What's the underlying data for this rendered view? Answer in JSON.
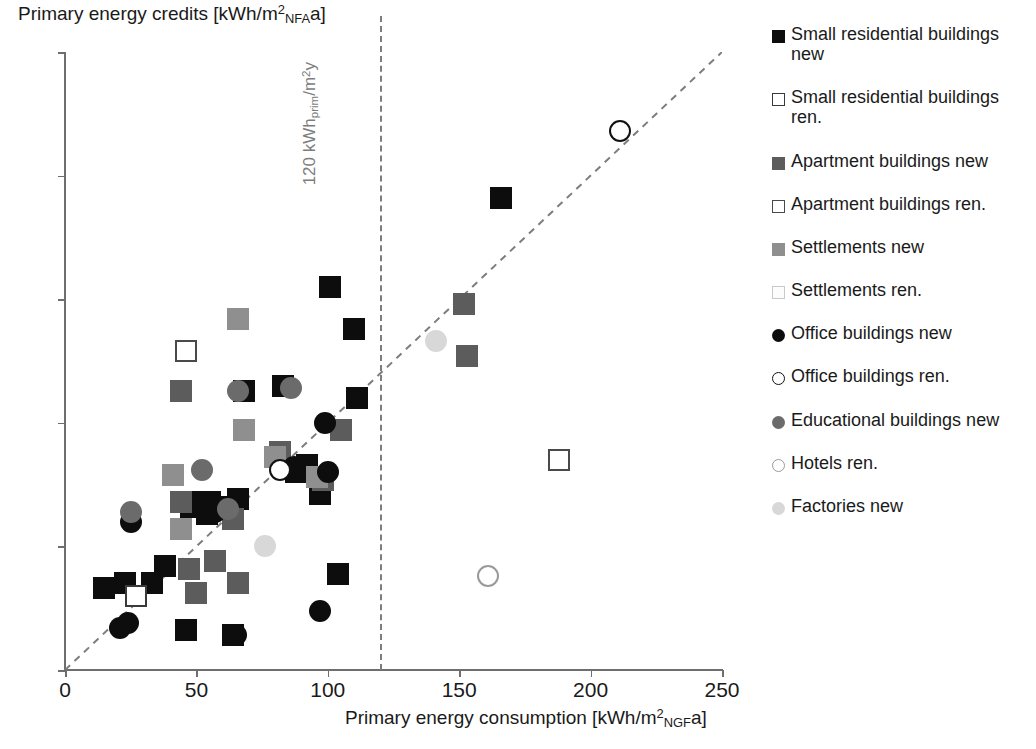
{
  "chart_data": {
    "type": "scatter",
    "title": "",
    "xlabel": "Primary energy consumption [kWh/m²NGFa]",
    "ylabel": "Primary energy credits [kWh/m²NFAa]",
    "xlabel_parts": {
      "pre": "Primary energy consumption [kWh/m",
      "sup": "2",
      "sub": "NGF",
      "post": "a]"
    },
    "ylabel_parts": {
      "pre": "Primary energy credits [kWh/m",
      "sup": "2",
      "sub": "NFA",
      "post": "a]"
    },
    "xlim": [
      0,
      250
    ],
    "ylim": [
      0,
      250
    ],
    "xticks": [
      0,
      50,
      100,
      150,
      200,
      250
    ],
    "yticks": [
      0,
      50,
      100,
      150,
      200,
      250
    ],
    "grid": false,
    "legend_position": "right",
    "annotations": [
      {
        "name": "zero-energy-line",
        "text": "zero energy",
        "type": "diagonal-dashed",
        "slope": 1,
        "intercept": 0,
        "color": "#7d7d7d"
      },
      {
        "name": "threshold-line",
        "text": "120 kWhprim/m²y",
        "text_parts": {
          "pre": "120 kWh",
          "sub": "prim",
          "post": "/m",
          "sup": "2",
          "tail": "y"
        },
        "type": "vertical-dashed",
        "x": 120,
        "color": "#7d7d7d"
      }
    ],
    "series": [
      {
        "name": "Small residential buildings new",
        "marker": "square",
        "fill": "#0d0d0d",
        "stroke": "#0d0d0d",
        "open": false,
        "points": [
          [
            15,
            33
          ],
          [
            23,
            35
          ],
          [
            33,
            35
          ],
          [
            38,
            42
          ],
          [
            46,
            16
          ],
          [
            47,
            68
          ],
          [
            48,
            66
          ],
          [
            54,
            63
          ],
          [
            55,
            68
          ],
          [
            60,
            66
          ],
          [
            64,
            14
          ],
          [
            66,
            69
          ],
          [
            68,
            113
          ],
          [
            83,
            115
          ],
          [
            88,
            80
          ],
          [
            92,
            83
          ],
          [
            97,
            71
          ],
          [
            101,
            155
          ],
          [
            104,
            39
          ],
          [
            110,
            138
          ],
          [
            111,
            110
          ],
          [
            166,
            191
          ]
        ]
      },
      {
        "name": "Small residential buildings ren.",
        "marker": "square",
        "fill": "#ffffff",
        "stroke": "#3a3a3a",
        "open": true,
        "points": [
          [
            27,
            30
          ]
        ]
      },
      {
        "name": "Apartment buildings new",
        "marker": "square",
        "fill": "#5c5c5c",
        "stroke": "#5c5c5c",
        "open": false,
        "points": [
          [
            44,
            113
          ],
          [
            44,
            68
          ],
          [
            47,
            41
          ],
          [
            50,
            31
          ],
          [
            57,
            44
          ],
          [
            64,
            61
          ],
          [
            66,
            35
          ],
          [
            82,
            88
          ],
          [
            98,
            77
          ],
          [
            105,
            97
          ],
          [
            152,
            148
          ],
          [
            153,
            127
          ]
        ]
      },
      {
        "name": "Apartment buildings ren.",
        "marker": "square",
        "fill": "#ffffff",
        "stroke": "#4a4a4a",
        "open": true,
        "points": [
          [
            46,
            129
          ],
          [
            188,
            85
          ]
        ]
      },
      {
        "name": "Settlements new",
        "marker": "square",
        "fill": "#8f8f8f",
        "stroke": "#8f8f8f",
        "open": false,
        "points": [
          [
            41,
            79
          ],
          [
            44,
            57
          ],
          [
            66,
            142
          ],
          [
            68,
            97
          ],
          [
            80,
            86
          ],
          [
            96,
            78
          ]
        ]
      },
      {
        "name": "Settlements ren.",
        "marker": "square",
        "fill": "#fcfcfc",
        "stroke": "#c9c9c9",
        "open": true,
        "points": []
      },
      {
        "name": "Office buildings new",
        "marker": "circle",
        "fill": "#0d0d0d",
        "stroke": "#0d0d0d",
        "open": false,
        "points": [
          [
            21,
            17
          ],
          [
            24,
            19
          ],
          [
            25,
            60
          ],
          [
            57,
            64
          ],
          [
            65,
            14
          ],
          [
            87,
            82
          ],
          [
            97,
            24
          ],
          [
            99,
            100
          ],
          [
            100,
            80
          ]
        ]
      },
      {
        "name": "Office buildings ren.",
        "marker": "circle",
        "fill": "#ffffff",
        "stroke": "#111111",
        "open": true,
        "points": [
          [
            82,
            81
          ],
          [
            211,
            218
          ]
        ]
      },
      {
        "name": "Educational buildings new",
        "marker": "circle",
        "fill": "#6b6b6b",
        "stroke": "#6b6b6b",
        "open": false,
        "points": [
          [
            25,
            64
          ],
          [
            52,
            81
          ],
          [
            62,
            65
          ],
          [
            66,
            113
          ],
          [
            86,
            114
          ]
        ]
      },
      {
        "name": "Hotels ren.",
        "marker": "circle",
        "fill": "#ffffff",
        "stroke": "#9a9a9a",
        "open": true,
        "points": [
          [
            161,
            38
          ]
        ]
      },
      {
        "name": "Factories new",
        "marker": "circle",
        "fill": "#d8d8d8",
        "stroke": "#d8d8d8",
        "open": false,
        "points": [
          [
            76,
            50
          ],
          [
            141,
            133
          ]
        ]
      }
    ]
  },
  "legend": {
    "items": [
      {
        "label": "Small residential buildings new"
      },
      {
        "label": "Small residential buildings ren."
      },
      {
        "label": "Apartment buildings new"
      },
      {
        "label": "Apartment buildings ren."
      },
      {
        "label": "Settlements new"
      },
      {
        "label": "Settlements ren."
      },
      {
        "label": "Office buildings new"
      },
      {
        "label": "Office buildings ren."
      },
      {
        "label": "Educational buildings new"
      },
      {
        "label": "Hotels ren."
      },
      {
        "label": "Factories new"
      }
    ]
  }
}
